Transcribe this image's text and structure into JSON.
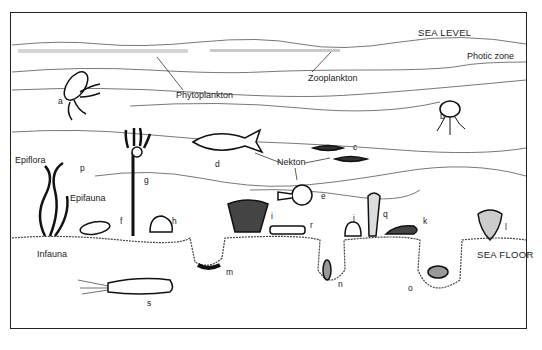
{
  "title_labels": {
    "sea_level": "SEA LEVEL",
    "sea_floor": "SEA FLOOR",
    "photic_zone": "Photic zone"
  },
  "group_labels": {
    "phytoplankton": "Phytoplankton",
    "zooplankton": "Zooplankton",
    "nekton": "Nekton",
    "epiflora": "Epiflora",
    "epifauna": "Epifauna",
    "infauna": "Infauna"
  },
  "organisms": [
    {
      "id": "a",
      "description": "jellyfish"
    },
    {
      "id": "b",
      "description": "jellyfish (medusa)"
    },
    {
      "id": "c",
      "description": "small fish (nekton)"
    },
    {
      "id": "d",
      "description": "fish (nekton)"
    },
    {
      "id": "e",
      "description": "nautiloid (nekton)"
    },
    {
      "id": "f",
      "description": "bivalve shell"
    },
    {
      "id": "g",
      "description": "crinoid (stalked)"
    },
    {
      "id": "h",
      "description": "gastropod"
    },
    {
      "id": "i",
      "description": "fan-shaped bryozoan/coral"
    },
    {
      "id": "j",
      "description": "brachiopod"
    },
    {
      "id": "k",
      "description": "starfish"
    },
    {
      "id": "l",
      "description": "sea anemone/coral"
    },
    {
      "id": "m",
      "description": "worm in burrow"
    },
    {
      "id": "n",
      "description": "burrowing bivalve"
    },
    {
      "id": "o",
      "description": "burrowing organism"
    },
    {
      "id": "p",
      "description": "seaweed"
    },
    {
      "id": "q",
      "description": "sponge"
    },
    {
      "id": "r",
      "description": "trilobite"
    },
    {
      "id": "s",
      "description": "sea cucumber"
    }
  ]
}
